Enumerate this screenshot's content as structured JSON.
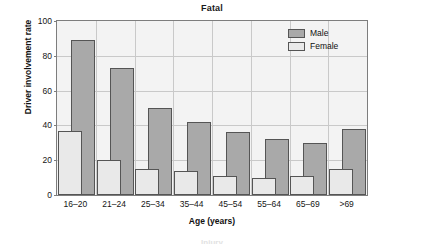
{
  "chart_data": {
    "type": "bar",
    "title": "Fatal",
    "xlabel": "Age (years)",
    "ylabel": "Driver involvement rate",
    "categories": [
      "16–20",
      "21–24",
      "25–34",
      "35–44",
      "45–54",
      "55–64",
      "65–69",
      ">69"
    ],
    "series": [
      {
        "name": "Male",
        "color": "#a9a9a9",
        "values": [
          89,
          73,
          50,
          42,
          36,
          32,
          30,
          38
        ]
      },
      {
        "name": "Female",
        "color": "#e9e9e9",
        "values": [
          37,
          20,
          15,
          14,
          11,
          10,
          11,
          15
        ]
      }
    ],
    "ylim": [
      0,
      100
    ],
    "yticks": [
      0,
      20,
      40,
      60,
      80,
      100
    ],
    "ytick_labels": [
      "0",
      "20",
      "40",
      "60",
      "80",
      "100"
    ],
    "grid": true,
    "legend_position": "top-right",
    "style": "overlapping-bars"
  },
  "legend": {
    "items": [
      {
        "label": "Male"
      },
      {
        "label": "Female"
      }
    ]
  },
  "footer": {
    "clipped_next_title": "Injury"
  }
}
